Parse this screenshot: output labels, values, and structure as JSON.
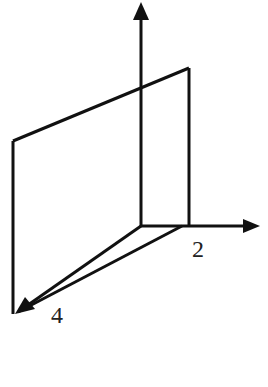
{
  "diagram": {
    "type": "3d-axes-with-plane",
    "colors": {
      "stroke": "#111111",
      "background": "#ffffff",
      "label": "#222222"
    },
    "axes": [
      {
        "name": "z-axis",
        "direction": "up",
        "label": ""
      },
      {
        "name": "y-axis",
        "direction": "right",
        "label": "2"
      },
      {
        "name": "x-axis",
        "direction": "down-left",
        "label": "4"
      }
    ],
    "plane": {
      "description": "vertical plane intersecting the y-axis at 2 and the x-axis at 4"
    },
    "labels": {
      "y_intercept": "2",
      "x_intercept": "4"
    }
  }
}
